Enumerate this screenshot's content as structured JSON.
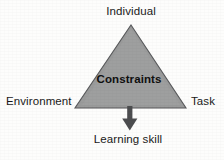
{
  "figure": {
    "type": "triangle-constraints-model",
    "background_color": "#fdfdfc",
    "labels": {
      "top": "Individual",
      "left": "Environment",
      "right": "Task",
      "center": "Constraints",
      "bottom": "Learning skill"
    },
    "shape": {
      "name": "constraints-triangle",
      "fill_color": "#9a9b9b",
      "stroke_color": "#58595b",
      "apex": {
        "x": 131,
        "y": 25
      },
      "bottom_left": {
        "x": 75,
        "y": 108
      },
      "bottom_right": {
        "x": 186,
        "y": 108
      }
    },
    "arrow": {
      "name": "learning-skill-arrow",
      "color": "#4c4d4f",
      "direction": "down",
      "from": {
        "x": 130,
        "y": 108
      },
      "to": {
        "x": 130,
        "y": 130
      }
    }
  }
}
